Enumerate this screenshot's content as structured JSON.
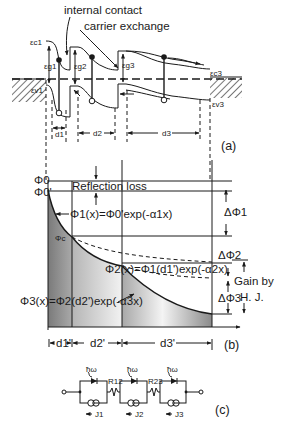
{
  "figure": {
    "panel_a": {
      "panel_label": "(a)",
      "annotation_internal_contact": "internal contact",
      "annotation_carrier_exchange": "carrier exchange",
      "labels": {
        "ec1": "εc1",
        "eg1": "εg1",
        "ev1": "εv1",
        "eg2": "εg2",
        "eg3": "εg3",
        "ec3": "εc3",
        "ev3": "εv3"
      },
      "thicknesses": [
        "d1",
        "d2",
        "d3"
      ]
    },
    "panel_b": {
      "panel_label": "(b)",
      "phi0": "Φ0",
      "phi0_prime": "Φ0'",
      "phi_c": "Φc",
      "reflection_loss": "Reflection loss",
      "eq1": "Φ1(x)=Φ0'exp(-α1x)",
      "eq2": "Φ2(x)=Φ1(d1')exp(-α2x)",
      "eq3": "Φ3(x)=Φ2(d2')exp(-α3x)",
      "delta1": "ΔΦ1",
      "delta2": "ΔΦ2",
      "delta3": "ΔΦ3",
      "gain_line1": "Gain by",
      "gain_line2": "H. J.",
      "thicknesses": [
        "d1'",
        "d2'",
        "d3'"
      ]
    },
    "panel_c": {
      "panel_label": "(c)",
      "photon": "ħω",
      "r12": "R12",
      "r23": "R23",
      "currents": [
        "J1",
        "J2",
        "J3"
      ]
    }
  }
}
